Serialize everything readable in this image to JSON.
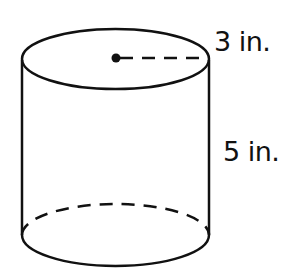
{
  "figure": {
    "shape": "cylinder",
    "radius_label": "3 in.",
    "height_label": "5 in.",
    "stroke_color": "#111111",
    "background_color": "#ffffff"
  }
}
